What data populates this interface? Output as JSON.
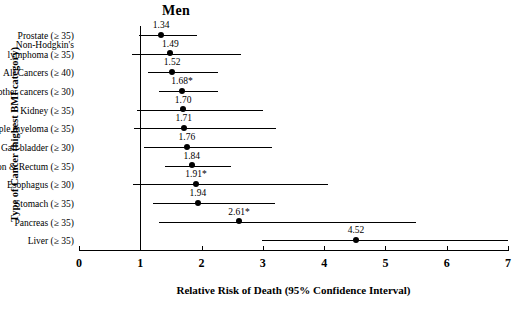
{
  "chart_data": {
    "type": "scatter",
    "title": "Men",
    "xlabel": "Relative Risk of Death  (95% Confidence Interval)",
    "ylabel": "Type of Cancer (highest BMI category)",
    "xlim": [
      0,
      7
    ],
    "xticks": [
      "0",
      "1",
      "2",
      "3",
      "4",
      "5",
      "6",
      "7"
    ],
    "grid": false,
    "reference_line_x": 1,
    "categories": [
      "Prostate   (≥ 35)",
      "Non-Hodgkin's\nlymphoma  (≥ 35)",
      "All Cancers   (≥ 40)",
      "All other cancers (≥ 30)",
      "Kidney (≥ 35)",
      "Multiple myeloma (≥ 35)",
      "Gall bladder  (≥ 30)",
      "Colon & Rectum   (≥ 35)",
      "Esophagus  (≥ 30)",
      "Stomach (≥ 35)",
      "Pancreas (≥ 35)",
      "Liver (≥ 35)"
    ],
    "rows": [
      {
        "label_line1": "Prostate   (≥ 35)",
        "label_line2": "",
        "value": 1.34,
        "value_label": "1.34",
        "ci_low": 0.98,
        "ci_high": 1.93
      },
      {
        "label_line1": "Non-Hodgkin's",
        "label_line2": "lymphoma  (≥ 35)",
        "value": 1.49,
        "value_label": "1.49",
        "ci_low": 0.87,
        "ci_high": 2.65
      },
      {
        "label_line1": "All Cancers   (≥ 40)",
        "label_line2": "",
        "value": 1.52,
        "value_label": "1.52",
        "ci_low": 1.13,
        "ci_high": 2.26
      },
      {
        "label_line1": "All other cancers (≥ 30)",
        "label_line2": "",
        "value": 1.68,
        "value_label": "1.68*",
        "ci_low": 1.3,
        "ci_high": 2.27
      },
      {
        "label_line1": "Kidney (≥ 35)",
        "label_line2": "",
        "value": 1.7,
        "value_label": "1.70",
        "ci_low": 0.95,
        "ci_high": 3.0
      },
      {
        "label_line1": "Multiple myeloma (≥ 35)",
        "label_line2": "",
        "value": 1.71,
        "value_label": "1.71",
        "ci_low": 0.89,
        "ci_high": 3.22
      },
      {
        "label_line1": "Gall bladder  (≥ 30)",
        "label_line2": "",
        "value": 1.76,
        "value_label": "1.76",
        "ci_low": 1.06,
        "ci_high": 3.15
      },
      {
        "label_line1": "Colon & Rectum   (≥ 35)",
        "label_line2": "",
        "value": 1.84,
        "value_label": "1.84",
        "ci_low": 1.4,
        "ci_high": 2.48
      },
      {
        "label_line1": "Esophagus  (≥ 30)",
        "label_line2": "",
        "value": 1.91,
        "value_label": "1.91*",
        "ci_low": 0.88,
        "ci_high": 4.07
      },
      {
        "label_line1": "Stomach (≥ 35)",
        "label_line2": "",
        "value": 1.94,
        "value_label": "1.94",
        "ci_low": 1.21,
        "ci_high": 3.2
      },
      {
        "label_line1": "Pancreas (≥ 35)",
        "label_line2": "",
        "value": 2.61,
        "value_label": "2.61*",
        "ci_low": 1.3,
        "ci_high": 5.5
      },
      {
        "label_line1": "Liver (≥ 35)",
        "label_line2": "",
        "value": 4.52,
        "value_label": "4.52",
        "ci_low": 2.98,
        "ci_high": 7.1
      }
    ]
  }
}
